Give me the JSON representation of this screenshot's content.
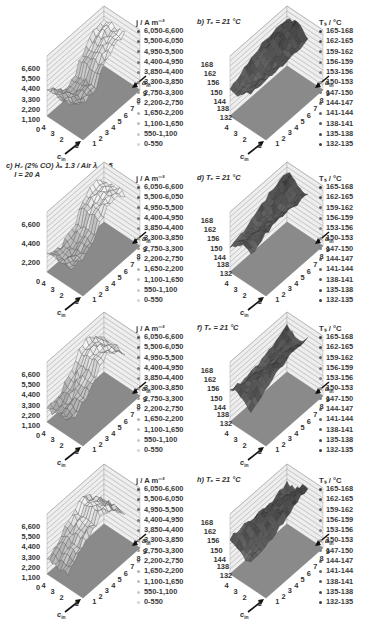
{
  "figure": {
    "panels": [
      {
        "id": "a",
        "title": "",
        "quantity": "j",
        "legend_title": "j / A m⁻²"
      },
      {
        "id": "b",
        "title": "b) Tₑ = 21 °C",
        "quantity": "Ts",
        "legend_title": "Tₛ / °C"
      },
      {
        "id": "c",
        "title": "c) H₂ (2% CO) λₐ 1.3 / Air λ꜀ 2.5\n    I = 20 A",
        "quantity": "j",
        "legend_title": "j / A m⁻²"
      },
      {
        "id": "d",
        "title": "d) Tₑ = 21 °C",
        "quantity": "Ts",
        "legend_title": "Tₛ / °C"
      },
      {
        "id": "e",
        "title": "",
        "quantity": "j",
        "legend_title": "j / A m⁻²"
      },
      {
        "id": "f",
        "title": "f) Tₑ = 21 °C",
        "quantity": "Ts",
        "legend_title": "Tₛ / °C"
      },
      {
        "id": "g",
        "title": "",
        "quantity": "j",
        "legend_title": "j / A m⁻²"
      },
      {
        "id": "h",
        "title": "h) Tₑ = 21 °C",
        "quantity": "Ts",
        "legend_title": "Tₛ / °C"
      }
    ],
    "j_legend": [
      "6,050-6,600",
      "5,500-6,050",
      "4,950-5,500",
      "4,400-4,950",
      "3,850-4,400",
      "3,300-3,850",
      "2,750-3,300",
      "2,200-2,750",
      "1,650-2,200",
      "1,100-1,650",
      "550-1,100",
      "0-550"
    ],
    "ts_legend": [
      "165-168",
      "162-165",
      "159-162",
      "156-159",
      "153-156",
      "150-153",
      "147-150",
      "144-147",
      "141-144",
      "138-141",
      "135-138",
      "132-135"
    ],
    "j_zticks": [
      "6,600",
      "5,500",
      "4,400",
      "3,300",
      "2,200",
      "1,100",
      "0"
    ],
    "c_j_zticks": [
      "6,600",
      "4,400",
      "2,200",
      "0"
    ],
    "ts_zticks": [
      "168",
      "162",
      "156",
      "150",
      "144",
      "138",
      "132"
    ],
    "axis_cin": "c",
    "axis_cin_sub": "in",
    "axis_ain": "a",
    "axis_ain_sub": "in",
    "cin_ticks": [
      "1",
      "2",
      "3",
      "4"
    ],
    "ain_ticks": [
      "1",
      "2",
      "3",
      "4",
      "5",
      "6",
      "7",
      "8",
      "9"
    ]
  },
  "chart_data": [
    {
      "type": "surface3d",
      "panel": "a",
      "title": "",
      "zlabel": "j / A m⁻²",
      "xlabel": "c_in",
      "ylabel": "a_in",
      "x_ticks": [
        1,
        2,
        3,
        4
      ],
      "y_ticks": [
        1,
        2,
        3,
        4,
        5,
        6,
        7,
        8,
        9
      ],
      "zlim": [
        0,
        6600
      ],
      "z_ticks": [
        0,
        1100,
        2200,
        3300,
        4400,
        5500,
        6600
      ],
      "legend_bins": [
        "6,050-6,600",
        "5,500-6,050",
        "4,950-5,500",
        "4,400-4,950",
        "3,850-4,400",
        "3,300-3,850",
        "2,750-3,300",
        "2,200-2,750",
        "1,650-2,200",
        "1,100-1,650",
        "550-1,100",
        "0-550"
      ]
    },
    {
      "type": "surface3d",
      "panel": "b",
      "title": "b) Tf = 21 °C",
      "zlabel": "Ts / °C",
      "xlabel": "c_in",
      "ylabel": "a_in",
      "x_ticks": [
        1,
        2,
        3,
        4
      ],
      "y_ticks": [
        1,
        2,
        3,
        4,
        5,
        6,
        7,
        8,
        9
      ],
      "zlim": [
        132,
        168
      ],
      "z_ticks": [
        132,
        138,
        144,
        150,
        156,
        162,
        168
      ],
      "legend_bins": [
        "165-168",
        "162-165",
        "159-162",
        "156-159",
        "153-156",
        "150-153",
        "147-150",
        "144-147",
        "141-144",
        "138-141",
        "135-138",
        "132-135"
      ]
    },
    {
      "type": "surface3d",
      "panel": "c",
      "title": "c) H2 (2% CO) λa 1.3 / Air λc 2.5, I = 20 A",
      "zlabel": "j / A m⁻²",
      "xlabel": "c_in",
      "ylabel": "a_in",
      "x_ticks": [
        1,
        2,
        3,
        4
      ],
      "y_ticks": [
        1,
        2,
        3,
        4,
        5,
        6,
        7,
        8,
        9
      ],
      "zlim": [
        0,
        6600
      ],
      "z_ticks": [
        0,
        2200,
        4400,
        6600
      ],
      "legend_bins": [
        "6,050-6,600",
        "5,500-6,050",
        "4,950-5,500",
        "4,400-4,950",
        "3,850-4,400",
        "3,300-3,850",
        "2,750-3,300",
        "2,200-2,750",
        "1,650-2,200",
        "1,100-1,650",
        "550-1,100",
        "0-550"
      ]
    },
    {
      "type": "surface3d",
      "panel": "d",
      "title": "d) Tf = 21 °C",
      "zlabel": "Ts / °C",
      "xlabel": "c_in",
      "ylabel": "a_in",
      "x_ticks": [
        1,
        2,
        3,
        4
      ],
      "y_ticks": [
        1,
        2,
        3,
        4,
        5,
        6,
        7,
        8,
        9
      ],
      "zlim": [
        132,
        168
      ],
      "z_ticks": [
        132,
        138,
        144,
        150,
        156,
        162,
        168
      ],
      "legend_bins": [
        "165-168",
        "162-165",
        "159-162",
        "156-159",
        "153-156",
        "150-153",
        "147-150",
        "144-147",
        "141-144",
        "138-141",
        "135-138",
        "132-135"
      ]
    },
    {
      "type": "surface3d",
      "panel": "e",
      "title": "",
      "zlabel": "j / A m⁻²",
      "xlabel": "c_in",
      "ylabel": "a_in",
      "x_ticks": [
        1,
        2,
        3,
        4
      ],
      "y_ticks": [
        1,
        2,
        3,
        4,
        5,
        6,
        7,
        8,
        9
      ],
      "zlim": [
        0,
        6600
      ],
      "z_ticks": [
        0,
        1100,
        2200,
        3300,
        4400,
        5500,
        6600
      ],
      "legend_bins": [
        "6,050-6,600",
        "5,500-6,050",
        "4,950-5,500",
        "4,400-4,950",
        "3,850-4,400",
        "3,300-3,850",
        "2,750-3,300",
        "2,200-2,750",
        "1,650-2,200",
        "1,100-1,650",
        "550-1,100",
        "0-550"
      ]
    },
    {
      "type": "surface3d",
      "panel": "f",
      "title": "f) Tf = 21 °C",
      "zlabel": "Ts / °C",
      "xlabel": "c_in",
      "ylabel": "a_in",
      "x_ticks": [
        1,
        2,
        3,
        4
      ],
      "y_ticks": [
        1,
        2,
        3,
        4,
        5,
        6,
        7,
        8,
        9
      ],
      "zlim": [
        132,
        168
      ],
      "z_ticks": [
        132,
        138,
        144,
        150,
        156,
        162,
        168
      ],
      "legend_bins": [
        "165-168",
        "162-165",
        "159-162",
        "156-159",
        "153-156",
        "150-153",
        "147-150",
        "144-147",
        "141-144",
        "138-141",
        "135-138",
        "132-135"
      ]
    },
    {
      "type": "surface3d",
      "panel": "g",
      "title": "",
      "zlabel": "j / A m⁻²",
      "xlabel": "c_in",
      "ylabel": "a_in",
      "x_ticks": [
        1,
        2,
        3,
        4
      ],
      "y_ticks": [
        1,
        2,
        3,
        4,
        5,
        6,
        7,
        8,
        9
      ],
      "zlim": [
        0,
        6600
      ],
      "z_ticks": [
        0,
        1100,
        2200,
        3300,
        4400,
        5500,
        6600
      ],
      "legend_bins": [
        "6,050-6,600",
        "5,500-6,050",
        "4,950-5,500",
        "4,400-4,950",
        "3,850-4,400",
        "3,300-3,850",
        "2,750-3,300",
        "2,200-2,750",
        "1,650-2,200",
        "1,100-1,650",
        "550-1,100",
        "0-550"
      ]
    },
    {
      "type": "surface3d",
      "panel": "h",
      "title": "h) Tf = 21 °C",
      "zlabel": "Ts / °C",
      "xlabel": "c_in",
      "ylabel": "a_in",
      "x_ticks": [
        1,
        2,
        3,
        4
      ],
      "y_ticks": [
        1,
        2,
        3,
        4,
        5,
        6,
        7,
        8,
        9
      ],
      "zlim": [
        132,
        168
      ],
      "z_ticks": [
        132,
        138,
        144,
        150,
        156,
        162,
        168
      ],
      "legend_bins": [
        "165-168",
        "162-165",
        "159-162",
        "156-159",
        "153-156",
        "150-153",
        "147-150",
        "144-147",
        "141-144",
        "138-141",
        "135-138",
        "132-135"
      ]
    }
  ],
  "colors": {
    "floor": "#8a8a8a",
    "wall": "#eeeeee",
    "wall_line": "#9a9a9a",
    "surface_j_light": "#e8e8e8",
    "surface_j_dark": "#9c9c9c",
    "surface_ts_light": "#8c8c8c",
    "surface_ts_dark": "#4a4a4a"
  }
}
